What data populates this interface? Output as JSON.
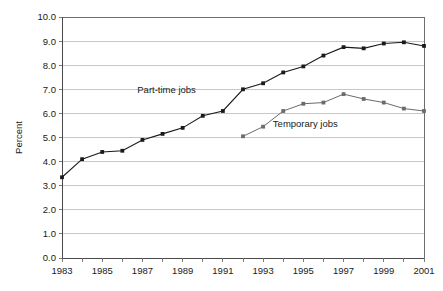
{
  "chart_data": {
    "type": "line",
    "title": "",
    "xlabel": "",
    "ylabel": "Percent",
    "ylim": [
      0,
      10
    ],
    "ytick_step": 1,
    "ytick_labels": [
      "0.0",
      "1.0",
      "2.0",
      "3.0",
      "4.0",
      "5.0",
      "6.0",
      "7.0",
      "8.0",
      "9.0",
      "10.0"
    ],
    "xlim": [
      1983,
      2001
    ],
    "xtick_labels": [
      "1983",
      "1985",
      "1987",
      "1989",
      "1991",
      "1993",
      "1995",
      "1997",
      "1999",
      "2001"
    ],
    "xtick_all_years": [
      1983,
      1984,
      1985,
      1986,
      1987,
      1988,
      1989,
      1990,
      1991,
      1992,
      1993,
      1994,
      1995,
      1996,
      1997,
      1998,
      1999,
      2000,
      2001
    ],
    "grid": "horizontal",
    "legend_position": "inline-annotation",
    "x": [
      1983,
      1984,
      1985,
      1986,
      1987,
      1988,
      1989,
      1990,
      1991,
      1992,
      1993,
      1994,
      1995,
      1996,
      1997,
      1998,
      1999,
      2000,
      2001
    ],
    "series": [
      {
        "name": "Part-time jobs",
        "color": "#1a1a1a",
        "marker": "square",
        "x": [
          1983,
          1984,
          1985,
          1986,
          1987,
          1988,
          1989,
          1990,
          1991,
          1992,
          1993,
          1994,
          1995,
          1996,
          1997,
          1998,
          1999,
          2000,
          2001
        ],
        "values": [
          3.35,
          4.1,
          4.4,
          4.45,
          4.9,
          5.15,
          5.4,
          5.9,
          6.1,
          7.0,
          7.25,
          7.7,
          7.95,
          8.4,
          8.75,
          8.7,
          8.9,
          8.95,
          8.8
        ],
        "label_text": "Part-time jobs",
        "label_x": 1988.2,
        "label_y": 6.85
      },
      {
        "name": "Temporary jobs",
        "color": "#6b6b6b",
        "marker": "square",
        "x": [
          1992,
          1993,
          1994,
          1995,
          1996,
          1997,
          1998,
          1999,
          2000,
          2001
        ],
        "values": [
          5.05,
          5.45,
          6.1,
          6.4,
          6.45,
          6.8,
          6.6,
          6.45,
          6.2,
          6.1
        ],
        "label_text": "Temporary jobs",
        "label_x": 1995.1,
        "label_y": 5.45
      }
    ]
  }
}
